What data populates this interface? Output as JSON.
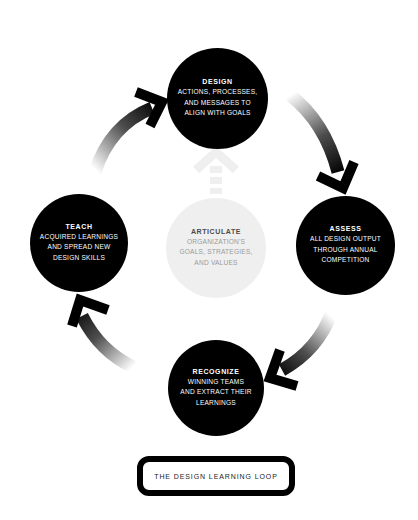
{
  "diagram": {
    "title": "THE DESIGN LEARNING LOOP",
    "colors": {
      "node_dark": "#000000",
      "node_light": "#efefef",
      "text_light": "#ffffff",
      "text_gray": "#9a9a9a",
      "arrow": "#000000",
      "center_arrow": "#f0f0f0"
    },
    "nodes": {
      "design": {
        "title": "DESIGN",
        "lines": [
          "ACTIONS, PROCESSES,",
          "AND MESSAGES TO",
          "ALIGN WITH GOALS"
        ]
      },
      "assess": {
        "title": "ASSESS",
        "lines": [
          "ALL DESIGN OUTPUT",
          "THROUGH ANNUAL",
          "COMPETITION"
        ]
      },
      "recognize": {
        "title": "RECOGNIZE",
        "lines": [
          "WINNING TEAMS",
          "AND EXTRACT THEIR",
          "LEARNINGS"
        ]
      },
      "teach": {
        "title": "TEACH",
        "lines": [
          "ACQUIRED LEARNINGS",
          "AND SPREAD NEW",
          "DESIGN SKILLS"
        ]
      },
      "articulate": {
        "title": "ARTICULATE",
        "lines": [
          "ORGANIZATION'S",
          "GOALS, STRATEGIES,",
          "AND VALUES"
        ]
      }
    },
    "flow": [
      "design",
      "assess",
      "recognize",
      "teach",
      "design"
    ],
    "center_flow": "articulate -> design"
  }
}
